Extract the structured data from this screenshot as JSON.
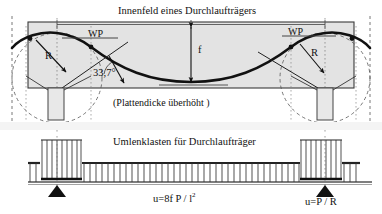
{
  "figure": {
    "domain": "structural-engineering-diagram",
    "title_top": "Innenfeld eines Durchlaufträgers",
    "note_slab": "(Plattendicke überhöht )",
    "title_mid": "Umlenklasten für Durchlaufträger",
    "labels": {
      "wp_left": "WP",
      "wp_right": "WP",
      "radius_left": "R",
      "radius_right": "R",
      "sag": "f",
      "angle": "33,7°"
    },
    "formulas": {
      "distributed_load": "u=8f P / l",
      "distributed_load_exponent": "2",
      "support_load": "u=P / R"
    },
    "colors": {
      "slab_fill": "#e2e2e2",
      "tendon": "#1a1a1a",
      "outline": "#333333",
      "dashed": "#555555",
      "band_fill": "#f2f2f2",
      "support": "#111111"
    }
  }
}
